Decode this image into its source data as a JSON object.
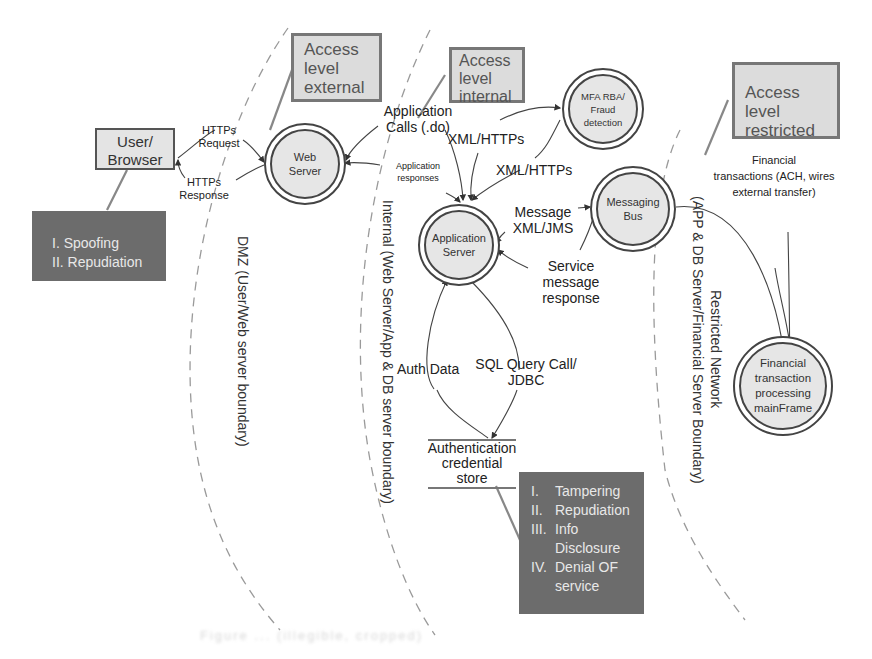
{
  "diagram": {
    "type": "data-flow threat model",
    "trust_zones": [
      {
        "id": "dmz",
        "label": "DMZ (User/Web server boundary)",
        "access_label": "Access level external"
      },
      {
        "id": "internal",
        "label": "Internal (Web Server/App & DB server boundary)",
        "access_label": "Access level internal"
      },
      {
        "id": "restricted",
        "label": "Restricted Network (APP & DB Server/Financial Server Boundary)",
        "access_label": "Access level restricted"
      }
    ],
    "access_boxes": {
      "external": {
        "line1": "Access",
        "line2": "level",
        "line3": "external"
      },
      "internal": {
        "line1": "Access",
        "line2": "level",
        "line3": "internal"
      },
      "restricted": {
        "line1": "Access level",
        "line2": "restricted"
      }
    },
    "zone_labels": {
      "dmz": "DMZ (User/Web server boundary)",
      "internal": "Internal (Web Server/App & DB server boundary)",
      "restricted_1": "Restricted Network",
      "restricted_2": "(APP & DB Server/Financial Server Boundary)"
    },
    "external_entity": {
      "line1": "User/",
      "line2": "Browser"
    },
    "processes": {
      "web_server": {
        "line1": "Web",
        "line2": "Server"
      },
      "app_server": {
        "line1": "Application",
        "line2": "Server"
      },
      "mfa": {
        "line1": "MFA RBA/",
        "line2": "Fraud",
        "line3": "detection"
      },
      "messaging_bus": {
        "line1": "Messaging",
        "line2": "Bus"
      },
      "mainframe": {
        "line1": "Financial",
        "line2": "transaction",
        "line3": "processing",
        "line4": "mainFrame"
      }
    },
    "data_store": {
      "line1": "Authentication",
      "line2": "credential",
      "line3": "store"
    },
    "flows": {
      "https_request": {
        "line1": "HTTPs",
        "line2": "Request"
      },
      "https_response": {
        "line1": "HTTPs",
        "line2": "Response"
      },
      "app_calls": {
        "line1": "Application",
        "line2": "Calls (.do)"
      },
      "app_responses": {
        "line1": "Application",
        "line2": "responses"
      },
      "xml_https_1": "XML/HTTPs",
      "xml_https_2": "XML/HTTPs",
      "message_jms": {
        "line1": "Message",
        "line2": "XML/JMS"
      },
      "service_response": {
        "line1": "Service",
        "line2": "message",
        "line3": "response"
      },
      "auth_data": "Auth Data",
      "sql_query": {
        "line1": "SQL Query Call/",
        "line2": "JDBC"
      },
      "financial_tx": {
        "line1": "Financial",
        "line2": "transactions (ACH, wires",
        "line3": "external transfer)"
      }
    },
    "threats": {
      "user": [
        "I. Spoofing",
        "II. Repudiation"
      ],
      "store": [
        {
          "num": "I.",
          "text": "Tampering"
        },
        {
          "num": "II.",
          "text": "Repudiation"
        },
        {
          "num": "III.",
          "text": "Info"
        },
        {
          "num": "",
          "text": "Disclosure"
        },
        {
          "num": "IV.",
          "text": "Denial OF"
        },
        {
          "num": "",
          "text": "service"
        }
      ]
    },
    "colors": {
      "access_box_fill": "#dcdcdc",
      "threat_fill": "#6c6c6c",
      "process_fill": "#e6e6e6",
      "line": "#555555"
    }
  },
  "caption": "Figure ... (illegible, cropped)"
}
